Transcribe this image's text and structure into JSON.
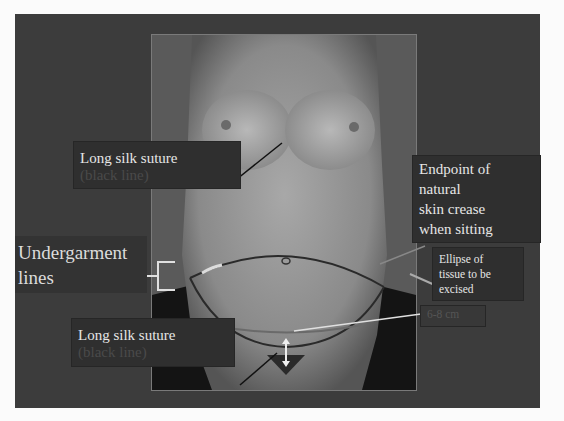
{
  "slide": {
    "background": "#3c3c3c",
    "photo_description": "Frontal view of female torso with surgical markings"
  },
  "labels": {
    "top_suture": {
      "line1": "Long silk suture",
      "line2": "(black line)"
    },
    "bottom_suture": {
      "line1": "Long silk suture",
      "line2": "(black line)"
    },
    "undergarment": {
      "line1": "Undergarment",
      "line2": "lines"
    },
    "endpoint": {
      "line1": "Endpoint of",
      "line2": "natural",
      "line3": "skin crease",
      "line4": "when sitting"
    },
    "ellipse": {
      "line1": "Ellipse of",
      "line2": "tissue to be",
      "line3": "excised"
    },
    "measurement": {
      "text": "6-8 cm"
    }
  }
}
